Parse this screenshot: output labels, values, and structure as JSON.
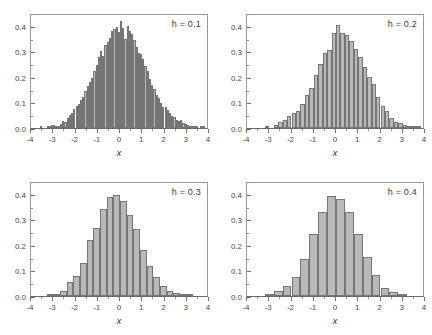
{
  "figure": {
    "panel_count": 4,
    "background_color": "#ffffff",
    "bar_fill_color": "#b9b9b9",
    "bar_border_color": "#757575",
    "axis_color": "#6b6b6b"
  },
  "chart_data": [
    {
      "type": "bar",
      "title": "h = 0.1",
      "xlabel": "x",
      "ylabel": "",
      "xlim": [
        -4,
        4
      ],
      "ylim": [
        0,
        0.45
      ],
      "grid": false,
      "legend": "none",
      "annotation": "h = 0.1",
      "bin_width": 0.1,
      "xticks": [
        -4,
        -3,
        -2,
        -1,
        0,
        1,
        2,
        3,
        4
      ],
      "xtick_labels": [
        "-4",
        "-3",
        "-2",
        "-1",
        "0",
        "1",
        "2",
        "3",
        "4"
      ],
      "xminor_step": 0.5,
      "yticks": [
        0.0,
        0.1,
        0.2,
        0.3,
        0.4
      ],
      "ytick_labels": [
        "0.0",
        "0.1",
        "0.2",
        "0.3",
        "0.4"
      ],
      "yminor_step": 0.05,
      "bin_centers": [
        -3.95,
        -3.85,
        -3.75,
        -3.65,
        -3.55,
        -3.45,
        -3.35,
        -3.25,
        -3.15,
        -3.05,
        -2.95,
        -2.85,
        -2.75,
        -2.65,
        -2.55,
        -2.45,
        -2.35,
        -2.25,
        -2.15,
        -2.05,
        -1.95,
        -1.85,
        -1.75,
        -1.65,
        -1.55,
        -1.45,
        -1.35,
        -1.25,
        -1.15,
        -1.05,
        -0.95,
        -0.85,
        -0.75,
        -0.65,
        -0.55,
        -0.45,
        -0.35,
        -0.25,
        -0.15,
        -0.05,
        0.05,
        0.15,
        0.25,
        0.35,
        0.45,
        0.55,
        0.65,
        0.75,
        0.85,
        0.95,
        1.05,
        1.15,
        1.25,
        1.35,
        1.45,
        1.55,
        1.65,
        1.75,
        1.85,
        1.95,
        2.05,
        2.15,
        2.25,
        2.35,
        2.45,
        2.55,
        2.65,
        2.75,
        2.85,
        2.95,
        3.05,
        3.15,
        3.25,
        3.35,
        3.45,
        3.55,
        3.65,
        3.75
      ],
      "values": [
        0.0,
        0.0,
        0.0,
        0.0,
        0.003,
        0.0,
        0.0,
        0.004,
        0.003,
        0.01,
        0.013,
        0.008,
        0.007,
        0.017,
        0.027,
        0.022,
        0.04,
        0.052,
        0.06,
        0.073,
        0.087,
        0.095,
        0.11,
        0.122,
        0.143,
        0.166,
        0.182,
        0.195,
        0.222,
        0.248,
        0.278,
        0.302,
        0.283,
        0.325,
        0.338,
        0.352,
        0.38,
        0.388,
        0.395,
        0.375,
        0.42,
        0.392,
        0.348,
        0.4,
        0.378,
        0.368,
        0.345,
        0.318,
        0.292,
        0.29,
        0.27,
        0.242,
        0.222,
        0.192,
        0.17,
        0.152,
        0.13,
        0.118,
        0.098,
        0.082,
        0.082,
        0.072,
        0.058,
        0.048,
        0.044,
        0.033,
        0.028,
        0.03,
        0.018,
        0.014,
        0.01,
        0.008,
        0.005,
        0.004,
        0.002,
        0.0,
        0.005,
        0.003
      ]
    },
    {
      "type": "bar",
      "title": "h = 0.2",
      "xlabel": "x",
      "ylabel": "",
      "xlim": [
        -4,
        4
      ],
      "ylim": [
        0,
        0.45
      ],
      "grid": false,
      "legend": "none",
      "annotation": "h = 0.2",
      "bin_width": 0.2,
      "xticks": [
        -4,
        -3,
        -2,
        -1,
        0,
        1,
        2,
        3,
        4
      ],
      "xtick_labels": [
        "-4",
        "-3",
        "-2",
        "-1",
        "0",
        "1",
        "2",
        "3",
        "4"
      ],
      "xminor_step": 0.5,
      "yticks": [
        0.0,
        0.1,
        0.2,
        0.3,
        0.4
      ],
      "ytick_labels": [
        "0.0",
        "0.1",
        "0.2",
        "0.3",
        "0.4"
      ],
      "yminor_step": 0.05,
      "bin_centers": [
        -3.9,
        -3.7,
        -3.5,
        -3.3,
        -3.1,
        -2.9,
        -2.7,
        -2.5,
        -2.3,
        -2.1,
        -1.9,
        -1.7,
        -1.5,
        -1.3,
        -1.1,
        -0.9,
        -0.7,
        -0.5,
        -0.3,
        -0.1,
        0.1,
        0.3,
        0.5,
        0.7,
        0.9,
        1.1,
        1.3,
        1.5,
        1.7,
        1.9,
        2.1,
        2.3,
        2.5,
        2.7,
        2.9,
        3.1,
        3.3,
        3.5,
        3.7,
        3.9
      ],
      "values": [
        0.0,
        0.0,
        0.0,
        0.0,
        0.009,
        0.0,
        0.01,
        0.022,
        0.03,
        0.048,
        0.058,
        0.068,
        0.095,
        0.128,
        0.158,
        0.208,
        0.252,
        0.293,
        0.305,
        0.37,
        0.402,
        0.37,
        0.365,
        0.34,
        0.31,
        0.278,
        0.24,
        0.2,
        0.172,
        0.12,
        0.085,
        0.065,
        0.04,
        0.022,
        0.018,
        0.01,
        0.005,
        0.002,
        0.003,
        0.0
      ]
    },
    {
      "type": "bar",
      "title": "h = 0.3",
      "xlabel": "x",
      "ylabel": "",
      "xlim": [
        -4,
        4
      ],
      "ylim": [
        0,
        0.45
      ],
      "grid": false,
      "legend": "none",
      "annotation": "h = 0.3",
      "bin_width": 0.3,
      "xticks": [
        -4,
        -3,
        -2,
        -1,
        0,
        1,
        2,
        3,
        4
      ],
      "xtick_labels": [
        "-4",
        "-3",
        "-2",
        "-1",
        "0",
        "1",
        "2",
        "3",
        "4"
      ],
      "xminor_step": 0.5,
      "yticks": [
        0.0,
        0.1,
        0.2,
        0.3,
        0.4
      ],
      "ytick_labels": [
        "0.0",
        "0.1",
        "0.2",
        "0.3",
        "0.4"
      ],
      "yminor_step": 0.05,
      "bin_centers": [
        -3.75,
        -3.45,
        -3.15,
        -2.85,
        -2.55,
        -2.25,
        -1.95,
        -1.65,
        -1.35,
        -1.05,
        -0.75,
        -0.45,
        -0.15,
        0.15,
        0.45,
        0.75,
        1.05,
        1.35,
        1.65,
        1.95,
        2.25,
        2.55,
        2.85,
        3.15,
        3.45,
        3.75
      ],
      "values": [
        0.0,
        0.0,
        0.003,
        0.003,
        0.02,
        0.053,
        0.078,
        0.128,
        0.218,
        0.266,
        0.342,
        0.388,
        0.396,
        0.37,
        0.318,
        0.263,
        0.18,
        0.116,
        0.074,
        0.04,
        0.018,
        0.01,
        0.003,
        0.002,
        0.0,
        0.0
      ]
    },
    {
      "type": "bar",
      "title": "h = 0.4",
      "xlabel": "x",
      "ylabel": "",
      "xlim": [
        -4,
        4
      ],
      "ylim": [
        0,
        0.45
      ],
      "grid": false,
      "legend": "none",
      "annotation": "h = 0.4",
      "bin_width": 0.4,
      "xticks": [
        -4,
        -3,
        -2,
        -1,
        0,
        1,
        2,
        3,
        4
      ],
      "xtick_labels": [
        "-4",
        "-3",
        "-2",
        "-1",
        "0",
        "1",
        "2",
        "3",
        "4"
      ],
      "xminor_step": 0.5,
      "yticks": [
        0.0,
        0.1,
        0.2,
        0.3,
        0.4
      ],
      "ytick_labels": [
        "0.0",
        "0.1",
        "0.2",
        "0.3",
        "0.4"
      ],
      "yminor_step": 0.05,
      "bin_centers": [
        -3.8,
        -3.4,
        -3.0,
        -2.6,
        -2.2,
        -1.8,
        -1.4,
        -1.0,
        -0.6,
        -0.2,
        0.2,
        0.6,
        1.0,
        1.4,
        1.8,
        2.2,
        2.6,
        3.0,
        3.4,
        3.8
      ],
      "values": [
        0.0,
        0.0,
        0.004,
        0.021,
        0.041,
        0.074,
        0.144,
        0.243,
        0.329,
        0.393,
        0.379,
        0.328,
        0.243,
        0.151,
        0.081,
        0.031,
        0.014,
        0.003,
        0.0,
        0.0
      ]
    }
  ]
}
